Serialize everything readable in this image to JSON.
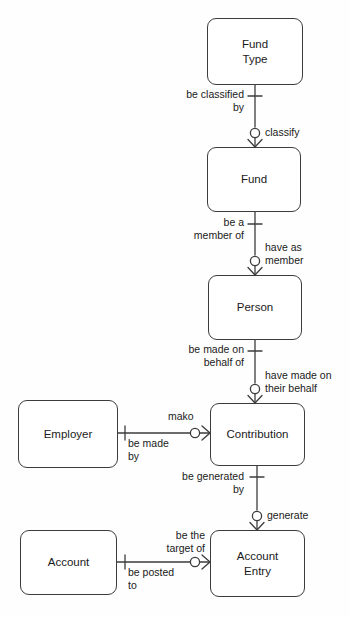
{
  "diagram": {
    "type": "entity-relationship-diagram",
    "notation": "crows-foot",
    "background_color": "#fefefe",
    "line_color": "#3c3c3c",
    "text_color": "#1a1a1a",
    "entities": [
      {
        "id": "fund-type",
        "label": "Fund\nType",
        "x": 207,
        "y": 18,
        "w": 96,
        "h": 67
      },
      {
        "id": "fund",
        "label": "Fund",
        "x": 207,
        "y": 147,
        "w": 94,
        "h": 65
      },
      {
        "id": "person",
        "label": "Person",
        "x": 208,
        "y": 275,
        "w": 94,
        "h": 65
      },
      {
        "id": "contribution",
        "label": "Contribution",
        "x": 210,
        "y": 403,
        "w": 95,
        "h": 63
      },
      {
        "id": "employer",
        "label": "Employer",
        "x": 18,
        "y": 400,
        "w": 100,
        "h": 68
      },
      {
        "id": "account",
        "label": "Account",
        "x": 20,
        "y": 530,
        "w": 97,
        "h": 65
      },
      {
        "id": "account-entry",
        "label": "Account\nEntry",
        "x": 210,
        "y": 530,
        "w": 95,
        "h": 67
      }
    ],
    "relationships": [
      {
        "id": "fundtype-fund",
        "from": "fund-type",
        "to": "fund",
        "orientation": "vertical",
        "from_label": "be classified\nby",
        "to_label": "classify",
        "from_cardinality": "one",
        "to_cardinality": "zero-or-many"
      },
      {
        "id": "fund-person",
        "from": "fund",
        "to": "person",
        "orientation": "vertical",
        "from_label": "be a\nmember of",
        "to_label": "have as\nmember",
        "from_cardinality": "one",
        "to_cardinality": "zero-or-many"
      },
      {
        "id": "person-contribution",
        "from": "person",
        "to": "contribution",
        "orientation": "vertical",
        "from_label": "be made on\nbehalf of",
        "to_label": "have made on\ntheir behalf",
        "from_cardinality": "one",
        "to_cardinality": "zero-or-many"
      },
      {
        "id": "employer-contribution",
        "from": "employer",
        "to": "contribution",
        "orientation": "horizontal",
        "from_label": "be made\nby",
        "to_label": "mako",
        "from_cardinality": "one",
        "to_cardinality": "zero-or-many"
      },
      {
        "id": "contribution-accountentry",
        "from": "contribution",
        "to": "account-entry",
        "orientation": "vertical",
        "from_label": "be generated\nby",
        "to_label": "generate",
        "from_cardinality": "one",
        "to_cardinality": "zero-or-many"
      },
      {
        "id": "account-accountentry",
        "from": "account",
        "to": "account-entry",
        "orientation": "horizontal",
        "from_label": "be posted\nto",
        "to_label": "be the\ntarget of",
        "from_cardinality": "one",
        "to_cardinality": "zero-or-many"
      }
    ],
    "labels": {
      "be_classified_by": "be classified\nby",
      "classify": "classify",
      "be_a_member_of": "be a\nmember of",
      "have_as_member": "have as\nmember",
      "be_made_on_behalf_of": "be made on\nbehalf of",
      "have_made_on_their_behalf": "have made on\ntheir behalf",
      "be_made_by": "be made\nby",
      "mako": "mako",
      "be_generated_by": "be generated\nby",
      "generate": "generate",
      "be_posted_to": "be posted\nto",
      "be_the_target_of": "be the\ntarget of"
    },
    "entity_names": {
      "fund_type": "Fund\nType",
      "fund": "Fund",
      "person": "Person",
      "contribution": "Contribution",
      "employer": "Employer",
      "account": "Account",
      "account_entry": "Account\nEntry"
    }
  }
}
